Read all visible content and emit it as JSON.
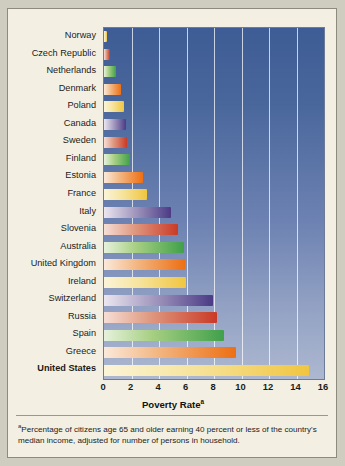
{
  "chart_data": {
    "type": "bar",
    "orientation": "horizontal",
    "title": "",
    "xlabel": "Poverty Rate",
    "xlabel_superscript": "a",
    "ylabel": "",
    "xlim": [
      0,
      16
    ],
    "xticks": [
      0,
      2,
      4,
      6,
      8,
      10,
      12,
      14,
      16
    ],
    "grid": "vertical",
    "legend": "none",
    "categories": [
      "Norway",
      "Czech Republic",
      "Netherlands",
      "Denmark",
      "Poland",
      "Canada",
      "Sweden",
      "Finland",
      "Estonia",
      "France",
      "Italy",
      "Slovenia",
      "Australia",
      "United Kingdom",
      "Ireland",
      "Switzerland",
      "Russia",
      "Spain",
      "Greece",
      "United States"
    ],
    "values": [
      0.2,
      0.4,
      0.9,
      1.2,
      1.45,
      1.6,
      1.65,
      1.9,
      2.85,
      3.1,
      4.9,
      5.4,
      5.8,
      5.9,
      5.95,
      7.9,
      8.2,
      8.7,
      9.6,
      14.9
    ],
    "bar_colors": [
      "yellow",
      "red",
      "green",
      "orange",
      "yellow",
      "purple",
      "red",
      "green",
      "orange",
      "yellow",
      "purple",
      "red",
      "green",
      "orange",
      "yellow",
      "purple",
      "red",
      "green",
      "orange",
      "yellow"
    ],
    "highlighted_category": "United States",
    "plot_background_top": "#3e5c95",
    "plot_background_bottom": "#adb8d0",
    "page_background": "#f3f0e3",
    "gridline_color": "#ffffff"
  },
  "footnote": {
    "marker": "a",
    "text": "Percentage of citizens age 65 and older earning 40 percent or less of the country's median income, adjusted for number of persons in household."
  }
}
